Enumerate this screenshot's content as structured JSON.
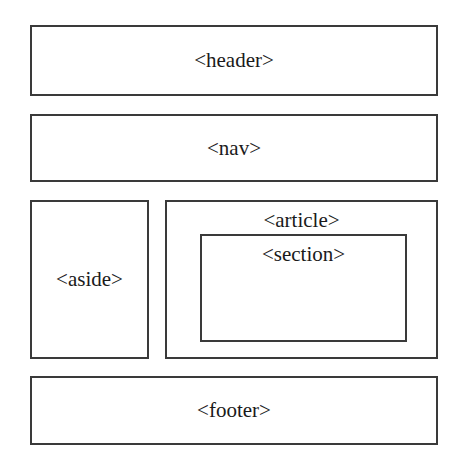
{
  "diagram": {
    "type": "html5-semantic-layout",
    "colors": {
      "border": "#3a3a3a",
      "background": "#ffffff",
      "text": "#1a1a1a"
    },
    "elements": {
      "header": {
        "label": "<header>"
      },
      "nav": {
        "label": "<nav>"
      },
      "aside": {
        "label": "<aside>"
      },
      "article": {
        "label": "<article>"
      },
      "section": {
        "label": "<section>",
        "parent": "article"
      },
      "footer": {
        "label": "<footer>"
      }
    }
  }
}
